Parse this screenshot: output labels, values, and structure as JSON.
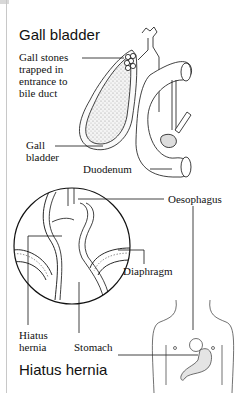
{
  "panels": [
    {
      "title": "Gall bladder",
      "labels": {
        "stones": [
          "Gall stones",
          "trapped in",
          "entrance to",
          "bile duct"
        ],
        "gall": [
          "Gall",
          "bladder"
        ],
        "duodenum": "Duodenum"
      }
    },
    {
      "title": "Hiatus hernia",
      "labels": {
        "oesophagus": "Oesophagus",
        "diaphragm": "Diaphragm",
        "hernia": [
          "Hiatus",
          "hernia"
        ],
        "stomach": "Stomach"
      }
    }
  ],
  "colors": {
    "line": "#111111",
    "border": "#c8c8c8",
    "shade": "#cfcfcf"
  }
}
